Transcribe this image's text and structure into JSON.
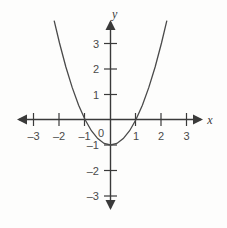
{
  "chart_data": {
    "type": "line",
    "title": "",
    "subtitle": "",
    "xlabel": "x",
    "ylabel": "y",
    "xlim": [
      -3.6,
      3.6
    ],
    "ylim": [
      -3.6,
      3.9
    ],
    "grid": false,
    "legend": false,
    "function": "y = x^2 - 1",
    "x_ticks": [
      -3,
      -2,
      -1,
      1,
      2,
      3
    ],
    "y_ticks": [
      3,
      2,
      1,
      -1,
      -2,
      -3
    ],
    "origin_label": "0",
    "x_tick_labels": [
      "–3",
      "–2",
      "–1",
      "1",
      "2",
      "3"
    ],
    "y_tick_labels": [
      "3",
      "2",
      "1",
      "–1",
      "–2",
      "–3"
    ],
    "vertex": [
      0,
      -1
    ],
    "roots": [
      -1,
      1
    ],
    "series": [
      {
        "name": "parabola",
        "color": "#4a4a4a",
        "x": [
          -2.21,
          -2.0,
          -1.75,
          -1.5,
          -1.25,
          -1.0,
          -0.75,
          -0.5,
          -0.25,
          0,
          0.25,
          0.5,
          0.75,
          1.0,
          1.25,
          1.5,
          1.75,
          2.0,
          2.21
        ],
        "y": [
          3.88,
          3.0,
          2.06,
          1.25,
          0.56,
          0,
          -0.44,
          -0.75,
          -0.94,
          -1.0,
          -0.94,
          -0.75,
          -0.44,
          0,
          0.56,
          1.25,
          2.06,
          3.0,
          3.88
        ]
      }
    ],
    "axis_arrows": [
      "left",
      "right",
      "up",
      "down"
    ]
  },
  "labels": {
    "x_axis_name": "x",
    "y_axis_name": "y"
  }
}
